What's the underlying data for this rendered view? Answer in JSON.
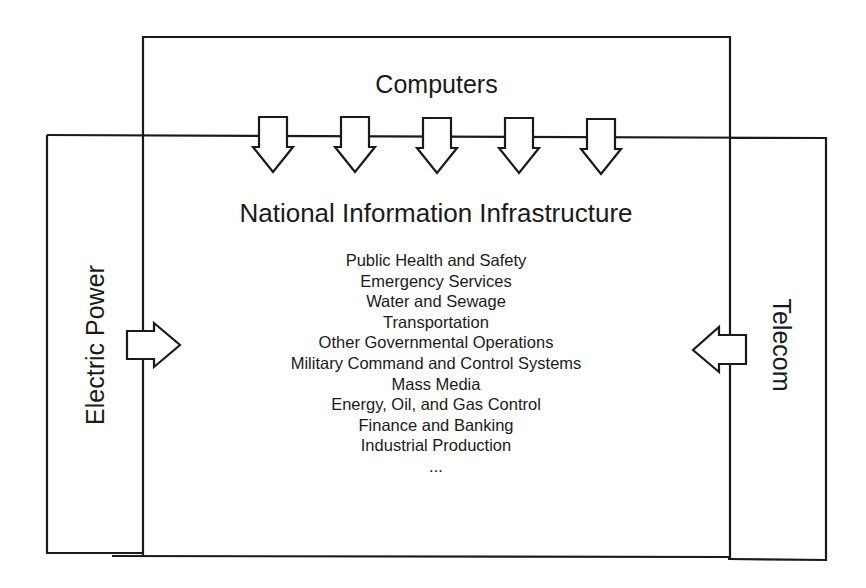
{
  "diagram": {
    "computers": {
      "label": "Computers",
      "arrow_count": 5,
      "arrow_direction": "down",
      "arrow_centers_x": [
        273,
        355,
        437,
        519,
        601
      ]
    },
    "electric_power": {
      "label": "Electric Power",
      "arrow_direction": "right"
    },
    "telecom": {
      "label": "Telecom",
      "arrow_direction": "left"
    },
    "nii": {
      "title": "National Information Infrastructure",
      "sectors": [
        "Public Health and Safety",
        "Emergency Services",
        "Water and Sewage",
        "Transportation",
        "Other Governmental Operations",
        "Military Command and Control Systems",
        "Mass Media",
        "Energy, Oil, and Gas Control",
        "Finance and Banking",
        "Industrial Production",
        "..."
      ]
    },
    "colors": {
      "line": "#1a1a1a",
      "background": "#ffffff",
      "text": "#1a1a1a"
    }
  }
}
